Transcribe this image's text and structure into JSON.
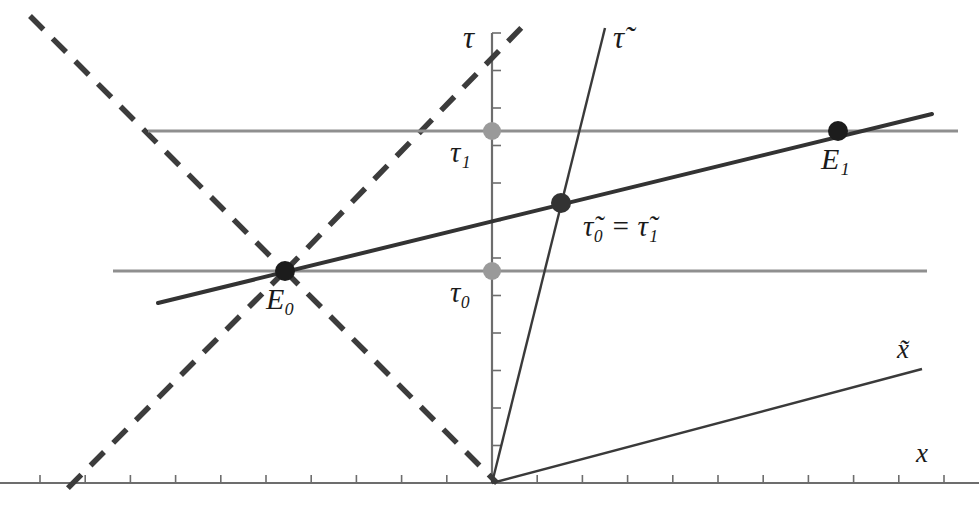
{
  "figure": {
    "width": 979,
    "height": 508,
    "background_color": "#ffffff"
  },
  "colors": {
    "axis_dark": "#3a3a3a",
    "worldline_dark": "#333333",
    "simultaneity_gray": "#8f8f8f",
    "event_dot_dark": "#1c1c1c",
    "event_dot_gray": "#9a9a9a",
    "lightcone_dashed": "#3c3c3c",
    "label_text": "#1a1a1a"
  },
  "axes": [
    {
      "name": "tau-axis",
      "label": "τ",
      "label_x": 463,
      "label_y": 22,
      "orientation": "vertical",
      "x": 492,
      "y_top": 33,
      "y_bottom": 483,
      "tick_count": 13,
      "tick_side": "right",
      "tick_length": 9,
      "color": "#6d6d6d"
    },
    {
      "name": "x-axis",
      "label": "x",
      "label_x": 916,
      "label_y": 440,
      "orientation": "horizontal",
      "y": 483,
      "x_left": 0,
      "x_right": 979,
      "tick_count": 21,
      "tick_side": "up",
      "tick_length": 8,
      "color": "#6d6d6d"
    },
    {
      "name": "tau-tilde-axis",
      "label": "τ̃",
      "label_x": 613,
      "label_y": 22,
      "x1": 492,
      "y1": 483,
      "x2": 605,
      "y2": 28,
      "color": "#3a3a3a"
    },
    {
      "name": "x-tilde-axis",
      "label": "x̃",
      "label_x": 897,
      "label_y": 336,
      "x1": 492,
      "y1": 483,
      "x2": 922,
      "y2": 369,
      "color": "#3a3a3a"
    }
  ],
  "worldline": {
    "name": "observer-worldline",
    "x1": 158,
    "y1": 303,
    "x2": 932,
    "y2": 114,
    "color": "#333333",
    "width": 4
  },
  "simultaneity_lines": [
    {
      "name": "simultaneity-line-tau0",
      "label": "τ₀",
      "x1": 113,
      "y1": 271,
      "x2": 927,
      "y2": 271,
      "color": "#8f8f8f",
      "width": 3
    },
    {
      "name": "simultaneity-line-tau1",
      "label": "τ₁",
      "x1": 148,
      "y1": 131,
      "x2": 958,
      "y2": 131,
      "color": "#8f8f8f",
      "width": 3
    }
  ],
  "lightcone": [
    {
      "name": "lightcone-ray-upper-left",
      "x1": 30,
      "y1": 16,
      "x2": 285,
      "y2": 271,
      "dash": "19 13"
    },
    {
      "name": "lightcone-ray-lower-right",
      "x1": 285,
      "y1": 271,
      "x2": 497,
      "y2": 483,
      "dash": "19 13"
    },
    {
      "name": "lightcone-ray-upper-right",
      "x1": 285,
      "y1": 271,
      "x2": 527,
      "y2": 22,
      "dash": "19 13"
    },
    {
      "name": "lightcone-ray-lower-left",
      "x1": 285,
      "y1": 271,
      "x2": 66,
      "y2": 490,
      "dash": "19 13"
    }
  ],
  "events": [
    {
      "name": "event-E0",
      "label": "E₀",
      "x": 285,
      "y": 271,
      "radius": 10,
      "color": "#1c1c1c",
      "label_x": 266,
      "label_y": 284
    },
    {
      "name": "event-E1",
      "label": "E₁",
      "x": 838,
      "y": 131,
      "radius": 10,
      "color": "#1c1c1c",
      "label_x": 821,
      "label_y": 144
    },
    {
      "name": "event-tau-tilde-coincidence",
      "label": "τ̃₀ = τ̃₁",
      "x": 561,
      "y": 203,
      "radius": 10,
      "color": "#333333",
      "label_x": 583,
      "label_y": 212
    },
    {
      "name": "tick-dot-tau0",
      "label": "τ₀",
      "x": 492,
      "y": 271,
      "radius": 9,
      "color": "#9a9a9a",
      "label_x": 450,
      "label_y": 278
    },
    {
      "name": "tick-dot-tau1",
      "label": "τ₁",
      "x": 492,
      "y": 131,
      "radius": 9,
      "color": "#9a9a9a",
      "label_x": 450,
      "label_y": 138
    }
  ],
  "labels": {
    "tau": "τ",
    "tau_tilde": "τ̃",
    "x": "x",
    "x_tilde": "x̃",
    "event0": "E₀",
    "event1": "E₁",
    "tau0": "τ₀",
    "tau1": "τ₁",
    "tau_tilde_equality": "τ̃₀ = τ̃₁"
  }
}
